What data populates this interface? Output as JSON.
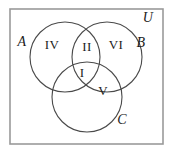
{
  "figure": {
    "type": "venn-diagram",
    "width": 173,
    "height": 156,
    "background_color": "#ffffff",
    "circle_stroke_color": "#4a4a4a",
    "rect_stroke_color": "#9a9a9a"
  },
  "universe": {
    "label": "U",
    "label_x": 148,
    "label_y": 18,
    "rect": {
      "x": 10,
      "y": 9,
      "width": 153,
      "height": 135
    }
  },
  "sets": [
    {
      "id": "A",
      "label": "A",
      "cx": 65,
      "cy": 57,
      "r": 35,
      "label_x": 22,
      "label_y": 42
    },
    {
      "id": "B",
      "label": "B",
      "cx": 107,
      "cy": 57,
      "r": 35,
      "label_x": 141,
      "label_y": 43
    },
    {
      "id": "C",
      "label": "C",
      "cx": 87,
      "cy": 97,
      "r": 35,
      "label_x": 122,
      "label_y": 120
    }
  ],
  "regions": [
    {
      "id": "region-iv",
      "label": "IV",
      "meaning": "A only",
      "x": 52,
      "y": 44
    },
    {
      "id": "region-ii",
      "label": "II",
      "meaning": "A and B only",
      "x": 87,
      "y": 46
    },
    {
      "id": "region-vi",
      "label": "VI",
      "meaning": "B only",
      "x": 116,
      "y": 44
    },
    {
      "id": "region-i",
      "label": "I",
      "meaning": "A and B and C",
      "x": 82,
      "y": 72
    },
    {
      "id": "region-v",
      "label": "V",
      "meaning": "B and C only",
      "x": 103,
      "y": 90
    }
  ]
}
